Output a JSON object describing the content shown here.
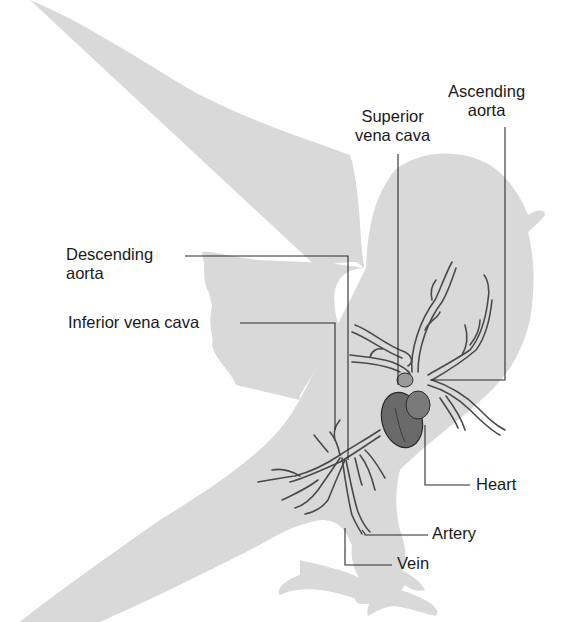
{
  "diagram": {
    "colors": {
      "background": "#ffffff",
      "silhouette": "#d9d9d9",
      "leader_line": "#2a2a2a",
      "vessel": "#555555",
      "heart": "#5a5a5a",
      "text": "#1a1a1a"
    },
    "labels": {
      "ascending_aorta": {
        "line1": "Ascending",
        "line2": "aorta"
      },
      "superior_vena_cava": {
        "line1": "Superior",
        "line2": "vena cava"
      },
      "descending_aorta": {
        "line1": "Descending",
        "line2": "aorta"
      },
      "inferior_vena_cava": {
        "line1": "Inferior vena cava"
      },
      "heart": {
        "line1": "Heart"
      },
      "artery": {
        "line1": "Artery"
      },
      "vein": {
        "line1": "Vein"
      }
    }
  }
}
